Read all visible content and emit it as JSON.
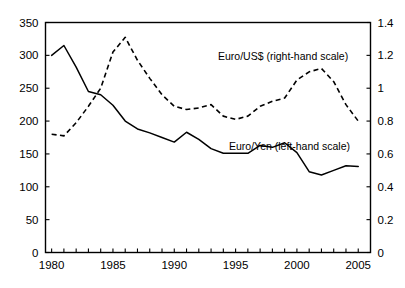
{
  "chart_data": {
    "type": "line",
    "title": "",
    "subtitle": "",
    "xlabel": "",
    "ylabel": "",
    "grid": false,
    "legend_position": "inline-annotation",
    "x": [
      1980,
      1981,
      1982,
      1983,
      1984,
      1985,
      1986,
      1987,
      1988,
      1989,
      1990,
      1991,
      1992,
      1993,
      1994,
      1995,
      1996,
      1997,
      1998,
      1999,
      2000,
      2001,
      2002,
      2003,
      2004,
      2005
    ],
    "xlim": [
      1979.5,
      2006.0
    ],
    "xticks": [
      1980,
      1981,
      1982,
      1983,
      1984,
      1985,
      1986,
      1987,
      1988,
      1989,
      1990,
      1991,
      1992,
      1993,
      1994,
      1995,
      1996,
      1997,
      1998,
      1999,
      2000,
      2001,
      2002,
      2003,
      2004,
      2005
    ],
    "xtick_labels": [
      "1980",
      "",
      "",
      "",
      "",
      "1985",
      "",
      "",
      "",
      "",
      "1990",
      "",
      "",
      "",
      "",
      "1995",
      "",
      "",
      "",
      "",
      "2000",
      "",
      "",
      "",
      "",
      "2005"
    ],
    "xtick_labels_shown": [
      "1980",
      "1985",
      "1990",
      "1995",
      "2000",
      "2005"
    ],
    "left_axis": {
      "label": "Euro/Yen (left-hand scale)",
      "ylim": [
        0,
        350
      ],
      "yticks": [
        0,
        50,
        100,
        150,
        200,
        250,
        300,
        350
      ],
      "ytick_labels": [
        "0",
        "50",
        "100",
        "150",
        "200",
        "250",
        "300",
        "350"
      ]
    },
    "right_axis": {
      "label": "Euro/US$ (right-hand scale)",
      "ylim": [
        0,
        1.4
      ],
      "yticks": [
        0,
        0.2,
        0.4,
        0.6,
        0.8,
        1.0,
        1.2,
        1.4
      ],
      "ytick_labels": [
        "0",
        "0.2",
        "0.4",
        "0.6",
        "0.8",
        "1",
        "1.2",
        "1.4"
      ]
    },
    "series": [
      {
        "name": "Euro/Yen (left-hand scale)",
        "axis": "left",
        "style": "solid",
        "values": [
          300,
          315,
          282,
          245,
          240,
          224,
          200,
          188,
          182,
          175,
          168,
          183,
          172,
          158,
          151,
          151,
          151,
          163,
          160,
          167,
          152,
          123,
          118,
          125,
          132,
          131
        ]
      },
      {
        "name": "Euro/US$ (right-hand scale)",
        "axis": "right",
        "style": "dashed",
        "values": [
          0.72,
          0.71,
          0.79,
          0.89,
          1.0,
          1.22,
          1.31,
          1.17,
          1.06,
          0.96,
          0.89,
          0.87,
          0.88,
          0.9,
          0.83,
          0.81,
          0.83,
          0.89,
          0.92,
          0.94,
          1.05,
          1.1,
          1.12,
          1.04,
          0.9,
          0.8
        ]
      }
    ]
  }
}
